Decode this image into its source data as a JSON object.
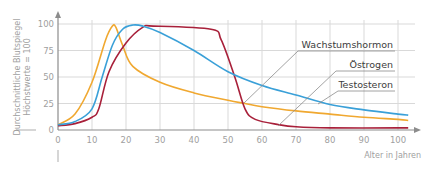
{
  "chart_data": {
    "type": "line",
    "title": "",
    "xlabel": "Alter in Jahren",
    "ylabel_line1": "Durchschnittliche Blutspiegel",
    "ylabel_line2": "Höchstwerte = 100",
    "xlim": [
      0,
      105
    ],
    "ylim": [
      0,
      100
    ],
    "x_ticks": [
      0,
      10,
      20,
      30,
      40,
      50,
      60,
      70,
      80,
      90,
      100
    ],
    "y_ticks": [
      0,
      25,
      50,
      75,
      100
    ],
    "grid": true,
    "legend_position": "right, with leader lines",
    "series": [
      {
        "name": "Wachstumshormon",
        "color": "#f0a830",
        "x": [
          0,
          5,
          10,
          14,
          16,
          17,
          19,
          22,
          30,
          40,
          50,
          55,
          60,
          70,
          80,
          90,
          100,
          103
        ],
        "y": [
          5,
          15,
          45,
          85,
          98,
          97,
          80,
          60,
          45,
          35,
          28,
          25,
          22,
          18,
          15,
          12,
          10,
          9
        ]
      },
      {
        "name": "Östrogen",
        "color": "#a8203a",
        "x": [
          0,
          5,
          10,
          12,
          15,
          20,
          25,
          28,
          45,
          48,
          52,
          55,
          58,
          65,
          70,
          80,
          100,
          103
        ],
        "y": [
          4,
          6,
          12,
          20,
          55,
          82,
          97,
          98,
          95,
          85,
          50,
          20,
          10,
          5,
          3,
          2,
          2,
          2
        ]
      },
      {
        "name": "Testosteron",
        "color": "#3aa0d8",
        "x": [
          0,
          5,
          10,
          13,
          16,
          19,
          22,
          25,
          30,
          40,
          50,
          60,
          70,
          80,
          90,
          100,
          103
        ],
        "y": [
          5,
          8,
          20,
          50,
          80,
          95,
          99,
          98,
          92,
          75,
          55,
          42,
          33,
          24,
          19,
          15,
          14
        ]
      }
    ],
    "legend": [
      {
        "label": "Wachstumshormon",
        "series": "Wachstumshormon"
      },
      {
        "label": "Östrogen",
        "series": "Östrogen"
      },
      {
        "label": "Testosteron",
        "series": "Testosteron"
      }
    ]
  },
  "colors": {
    "grid": "#d9d9d9",
    "axis": "#8c8c8c",
    "text": "#a0a0a0",
    "legend_text": "#3c3c3c"
  }
}
